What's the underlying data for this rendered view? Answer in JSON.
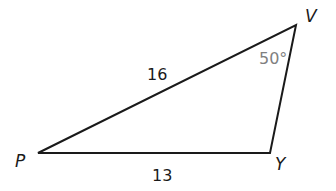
{
  "diagram": {
    "type": "triangle",
    "vertices": [
      {
        "name": "P",
        "x": 38,
        "y": 153
      },
      {
        "name": "Y",
        "x": 270,
        "y": 153
      },
      {
        "name": "V",
        "x": 296,
        "y": 25
      }
    ],
    "labels": {
      "vertex_p": "P",
      "vertex_y": "Y",
      "vertex_v": "V",
      "side_pv": "16",
      "side_py": "13",
      "angle_v": "50°"
    },
    "colors": {
      "stroke": "#1a1a1a",
      "text": "#1a1a1a",
      "angle_text": "#808080",
      "background": "#ffffff"
    }
  }
}
